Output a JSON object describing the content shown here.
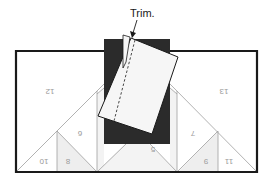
{
  "diagram": {
    "type": "paper-piecing-instruction",
    "callout": {
      "text": "Trim.",
      "target": "fabric-edge-along-seam-line"
    },
    "pieces": [
      {
        "id": "12",
        "label": "12"
      },
      {
        "id": "13",
        "label": "13"
      },
      {
        "id": "6",
        "label": "6"
      },
      {
        "id": "7",
        "label": "7"
      },
      {
        "id": "5",
        "label": "5"
      },
      {
        "id": "10",
        "label": "10"
      },
      {
        "id": "8",
        "label": "8"
      },
      {
        "id": "9",
        "label": "9"
      },
      {
        "id": "11",
        "label": "11"
      }
    ],
    "labels_mirrored": true,
    "colors": {
      "outline": "#1a1a1a",
      "dark_fabric": "#2b2b2b",
      "light_fabric": "#f6f6f6",
      "seam_lines": "#9e9e9e",
      "shaded_piece": "#eeeeee",
      "number_text": "#9a9a9a"
    }
  }
}
